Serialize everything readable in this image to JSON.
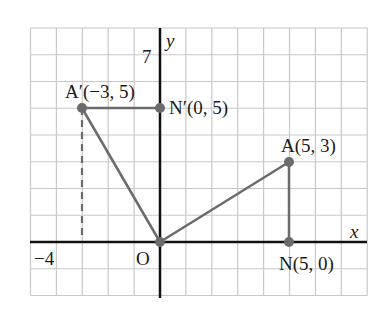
{
  "diagram": {
    "type": "coordinate-plane",
    "grid": {
      "x_min": -5,
      "x_max": 8,
      "y_min": -2,
      "y_max": 8,
      "color": "#c8c8c8"
    },
    "axes": {
      "x_label": "x",
      "y_label": "y",
      "color": "#111111"
    },
    "tick_labels": {
      "y_top": "7",
      "x_left": "−4",
      "origin": "O"
    },
    "points": [
      {
        "name": "A'",
        "label": "A′(−3, 5)",
        "x": -3,
        "y": 5
      },
      {
        "name": "N'",
        "label": "N′(0, 5)",
        "x": 0,
        "y": 5
      },
      {
        "name": "O",
        "label": "O",
        "x": 0,
        "y": 0
      },
      {
        "name": "A",
        "label": "A(5, 3)",
        "x": 5,
        "y": 3
      },
      {
        "name": "N",
        "label": "N(5, 0)",
        "x": 5,
        "y": 0
      }
    ],
    "segments": [
      {
        "from": "A'",
        "to": "N'",
        "style": "solid"
      },
      {
        "from": "A'",
        "to": "O",
        "style": "solid"
      },
      {
        "from": "O",
        "to": "A",
        "style": "solid"
      },
      {
        "from": "A",
        "to": "N",
        "style": "solid"
      },
      {
        "from": "A'",
        "to": "(-3,0)",
        "style": "dashed"
      }
    ],
    "colors": {
      "shape": "#6b6b6b",
      "point": "#6b6b6b"
    }
  }
}
